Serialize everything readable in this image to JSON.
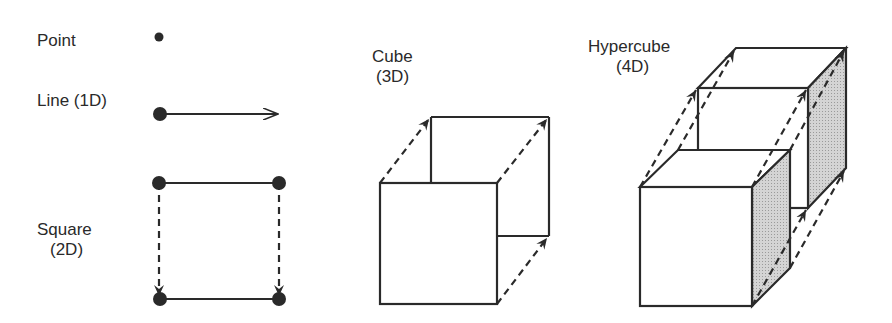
{
  "labels": {
    "point": "Point",
    "line": "Line (1D)",
    "square": "Square",
    "square_dim": "(2D)",
    "cube": "Cube",
    "cube_dim": "(3D)",
    "hypercube": "Hypercube",
    "hypercube_dim": "(4D)"
  },
  "colors": {
    "stroke": "#2a2a2a",
    "shade": "#c8c8c8",
    "background": "#ffffff"
  },
  "figures": [
    {
      "name": "point",
      "dimension": 0
    },
    {
      "name": "line",
      "dimension": 1
    },
    {
      "name": "square",
      "dimension": 2
    },
    {
      "name": "cube",
      "dimension": 3
    },
    {
      "name": "hypercube",
      "dimension": 4
    }
  ]
}
